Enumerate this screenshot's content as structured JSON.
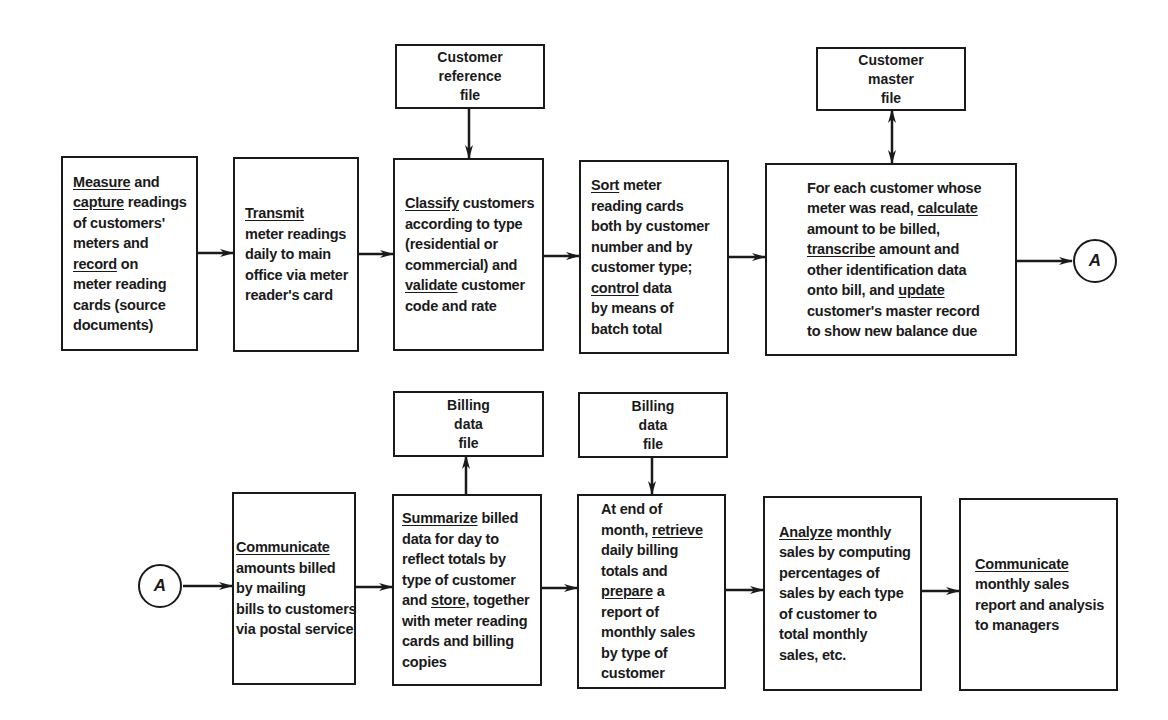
{
  "diagram": {
    "type": "flowchart",
    "row1": {
      "steps": [
        {
          "id": "measure",
          "lines": [
            [
              {
                "t": "Measure",
                "u": true
              },
              {
                "t": " and"
              }
            ],
            [
              {
                "t": "capture",
                "u": true
              },
              {
                "t": " readings"
              }
            ],
            [
              {
                "t": "of customers'"
              }
            ],
            [
              {
                "t": "meters and"
              }
            ],
            [
              {
                "t": "record",
                "u": true
              },
              {
                "t": " on"
              }
            ],
            [
              {
                "t": "meter reading"
              }
            ],
            [
              {
                "t": "cards (source"
              }
            ],
            [
              {
                "t": "documents)"
              }
            ]
          ]
        },
        {
          "id": "transmit",
          "lines": [
            [
              {
                "t": "Transmit",
                "u": true
              }
            ],
            [
              {
                "t": "meter readings"
              }
            ],
            [
              {
                "t": "daily to main"
              }
            ],
            [
              {
                "t": "office via meter"
              }
            ],
            [
              {
                "t": "reader's card"
              }
            ]
          ]
        },
        {
          "id": "classify",
          "lines": [
            [
              {
                "t": "Classify",
                "u": true
              },
              {
                "t": " customers"
              }
            ],
            [
              {
                "t": "according to type"
              }
            ],
            [
              {
                "t": "(residential or"
              }
            ],
            [
              {
                "t": "commercial) and"
              }
            ],
            [
              {
                "t": "validate",
                "u": true
              },
              {
                "t": " customer"
              }
            ],
            [
              {
                "t": "code and rate"
              }
            ]
          ]
        },
        {
          "id": "sort",
          "lines": [
            [
              {
                "t": "Sort",
                "u": true
              },
              {
                "t": " meter"
              }
            ],
            [
              {
                "t": "reading cards"
              }
            ],
            [
              {
                "t": "both by customer"
              }
            ],
            [
              {
                "t": "number and by"
              }
            ],
            [
              {
                "t": "customer type;"
              }
            ],
            [
              {
                "t": "control",
                "u": true
              },
              {
                "t": " data"
              }
            ],
            [
              {
                "t": "by means of"
              }
            ],
            [
              {
                "t": "batch total"
              }
            ]
          ]
        },
        {
          "id": "calculate",
          "lines": [
            [
              {
                "t": "For each customer whose"
              }
            ],
            [
              {
                "t": "meter was read, "
              },
              {
                "t": "calculate",
                "u": true
              }
            ],
            [
              {
                "t": "amount to be billed,"
              }
            ],
            [
              {
                "t": "transcribe",
                "u": true
              },
              {
                "t": " amount and"
              }
            ],
            [
              {
                "t": "other identification data"
              }
            ],
            [
              {
                "t": "onto bill, and "
              },
              {
                "t": "update",
                "u": true
              }
            ],
            [
              {
                "t": "customer's master record"
              }
            ],
            [
              {
                "t": "to show new balance due"
              }
            ]
          ]
        }
      ],
      "files": [
        {
          "id": "customer-reference-file",
          "lines": [
            "Customer",
            "reference",
            "file"
          ],
          "attached_to": "classify",
          "direction": "into-process"
        },
        {
          "id": "customer-master-file",
          "lines": [
            "Customer",
            "master",
            "file"
          ],
          "attached_to": "calculate",
          "direction": "bidirectional"
        }
      ],
      "connector_out": "A"
    },
    "row2": {
      "connector_in": "A",
      "steps": [
        {
          "id": "communicate-bills",
          "lines": [
            [
              {
                "t": "Communicate",
                "u": true
              }
            ],
            [
              {
                "t": "amounts billed"
              }
            ],
            [
              {
                "t": "by mailing"
              }
            ],
            [
              {
                "t": "bills to customers"
              }
            ],
            [
              {
                "t": "via postal service"
              }
            ]
          ]
        },
        {
          "id": "summarize",
          "lines": [
            [
              {
                "t": "Summarize",
                "u": true
              },
              {
                "t": " billed"
              }
            ],
            [
              {
                "t": "data for day to"
              }
            ],
            [
              {
                "t": "reflect totals by"
              }
            ],
            [
              {
                "t": "type of customer"
              }
            ],
            [
              {
                "t": "and "
              },
              {
                "t": "store",
                "u": true
              },
              {
                "t": ", together"
              }
            ],
            [
              {
                "t": "with meter reading"
              }
            ],
            [
              {
                "t": "cards and billing"
              }
            ],
            [
              {
                "t": "copies"
              }
            ]
          ]
        },
        {
          "id": "retrieve",
          "lines": [
            [
              {
                "t": "At end of"
              }
            ],
            [
              {
                "t": "month, "
              },
              {
                "t": "retrieve",
                "u": true
              }
            ],
            [
              {
                "t": "daily billing"
              }
            ],
            [
              {
                "t": "totals and"
              }
            ],
            [
              {
                "t": "prepare",
                "u": true
              },
              {
                "t": " a"
              }
            ],
            [
              {
                "t": "report of"
              }
            ],
            [
              {
                "t": "monthly sales"
              }
            ],
            [
              {
                "t": "by type of"
              }
            ],
            [
              {
                "t": "customer"
              }
            ]
          ]
        },
        {
          "id": "analyze",
          "lines": [
            [
              {
                "t": "Analyze",
                "u": true
              },
              {
                "t": " monthly"
              }
            ],
            [
              {
                "t": "sales by computing"
              }
            ],
            [
              {
                "t": "percentages of"
              }
            ],
            [
              {
                "t": "sales by each type"
              }
            ],
            [
              {
                "t": "of customer to"
              }
            ],
            [
              {
                "t": "total monthly"
              }
            ],
            [
              {
                "t": "sales, etc."
              }
            ]
          ]
        },
        {
          "id": "communicate-report",
          "lines": [
            [
              {
                "t": "Communicate",
                "u": true
              }
            ],
            [
              {
                "t": "monthly sales"
              }
            ],
            [
              {
                "t": "report and analysis"
              }
            ],
            [
              {
                "t": "to managers"
              }
            ]
          ]
        }
      ],
      "files": [
        {
          "id": "billing-data-file-1",
          "lines": [
            "Billing",
            "data",
            "file"
          ],
          "attached_to": "summarize",
          "direction": "out-of-process"
        },
        {
          "id": "billing-data-file-2",
          "lines": [
            "Billing",
            "data",
            "file"
          ],
          "attached_to": "retrieve",
          "direction": "into-process"
        }
      ]
    },
    "colors": {
      "ink": "#1a1a1a",
      "paper": "#ffffff"
    }
  }
}
